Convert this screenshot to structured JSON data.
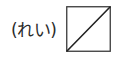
{
  "example": {
    "label": "(れい)",
    "box": {
      "type": "square-with-diagonal",
      "diagonal": "bottom-left-to-top-right",
      "stroke_color": "#333333",
      "fill_color": "#ffffff"
    }
  }
}
